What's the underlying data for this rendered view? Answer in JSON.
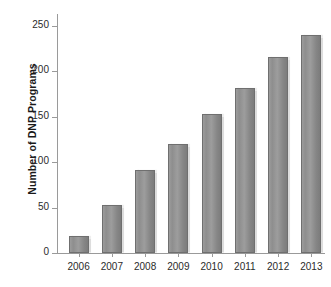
{
  "chart_data": {
    "type": "bar",
    "title": "",
    "xlabel": "",
    "ylabel": "Number of DNP Programs",
    "categories": [
      "2006",
      "2007",
      "2008",
      "2009",
      "2010",
      "2011",
      "2012",
      "2013"
    ],
    "values": [
      19,
      53,
      91,
      120,
      153,
      182,
      216,
      240
    ],
    "ylim": [
      0,
      250
    ],
    "yticks": [
      0,
      50,
      100,
      150,
      200,
      250
    ],
    "ytick_labels": [
      "0",
      "50",
      "100",
      "150",
      "200",
      "250"
    ],
    "grid": false,
    "legend": null,
    "bar_color": "#8e8e8e",
    "bar_edge_color": "#6f6f6f",
    "axis_color": "#9a9a9a",
    "background": "#ffffff"
  }
}
